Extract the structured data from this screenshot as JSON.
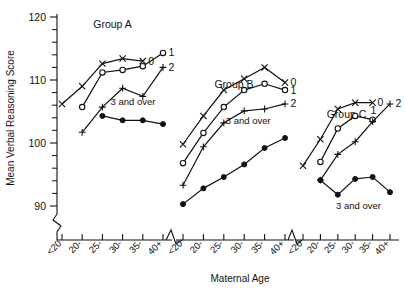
{
  "chart_data": {
    "type": "line",
    "title": "",
    "xlabel": "Maternal Age",
    "ylabel": "Mean Verbal Reasoning Score",
    "ylim": [
      88,
      121
    ],
    "yticks": [
      90,
      100,
      110,
      120
    ],
    "ytick_labels": [
      "90",
      "100",
      "110",
      "120"
    ],
    "y_axis_break": true,
    "grid": false,
    "legend_position": "inline-right-of-line-end",
    "categories": [
      "<20",
      "20-",
      "25-",
      "30-",
      "35-",
      "40+"
    ],
    "panels": [
      {
        "name": "Group A",
        "title": "Group A",
        "series": [
          {
            "name": "0",
            "label": "0",
            "marker": "x",
            "values": [
              106.2,
              109.0,
              112.6,
              113.4,
              113.0,
              null
            ]
          },
          {
            "name": "1",
            "label": "1",
            "marker": "open-circle",
            "values": [
              null,
              105.7,
              111.2,
              111.6,
              112.2,
              114.3
            ]
          },
          {
            "name": "2",
            "label": "2",
            "marker": "plus",
            "values": [
              null,
              101.7,
              105.7,
              108.7,
              107.4,
              112.0
            ]
          },
          {
            "name": "3 and over",
            "label": "3 and over",
            "marker": "filled-circle",
            "values": [
              null,
              null,
              104.3,
              103.6,
              103.6,
              103.0
            ]
          }
        ]
      },
      {
        "name": "Group B",
        "title": "Group B",
        "series": [
          {
            "name": "0",
            "label": "0",
            "marker": "x",
            "values": [
              99.8,
              104.3,
              108.4,
              110.2,
              112.0,
              109.6
            ]
          },
          {
            "name": "1",
            "label": "1",
            "marker": "open-circle",
            "values": [
              96.8,
              101.6,
              105.7,
              108.4,
              109.4,
              108.4
            ]
          },
          {
            "name": "2",
            "label": "2",
            "marker": "plus",
            "values": [
              93.3,
              99.4,
              103.2,
              105.1,
              105.4,
              106.2
            ]
          },
          {
            "name": "3 and over",
            "label": "3 and over",
            "marker": "filled-circle",
            "values": [
              90.3,
              92.8,
              94.6,
              96.6,
              99.2,
              100.8
            ]
          }
        ]
      },
      {
        "name": "Group C",
        "title": "Group C",
        "series": [
          {
            "name": "0",
            "label": "0",
            "marker": "x",
            "values": [
              96.4,
              100.6,
              105.4,
              106.4,
              106.4,
              null
            ]
          },
          {
            "name": "1",
            "label": "1",
            "marker": "open-circle",
            "values": [
              null,
              97.0,
              102.3,
              104.3,
              103.7,
              null
            ]
          },
          {
            "name": "2",
            "label": "2",
            "marker": "plus",
            "values": [
              null,
              94.1,
              98.2,
              100.2,
              103.4,
              106.2
            ]
          },
          {
            "name": "3 and over",
            "label": "3 and over",
            "marker": "filled-circle",
            "values": [
              null,
              94.1,
              91.8,
              94.3,
              94.6,
              92.2
            ]
          }
        ]
      }
    ]
  },
  "axes": {
    "y_title": "Mean Verbal Reasoning Score",
    "x_title": "Maternal Age",
    "y_tick_0": "90",
    "y_tick_1": "100",
    "y_tick_2": "110",
    "y_tick_3": "120"
  },
  "panel_titles": {
    "a": "Group A",
    "b": "Group B",
    "c": "Group C"
  },
  "series_labels": {
    "zero": "0",
    "one": "1",
    "two": "2",
    "three_plus": "3 and over"
  },
  "x_categories": {
    "c0": "<20",
    "c1": "20-",
    "c2": "25-",
    "c3": "30-",
    "c4": "35-",
    "c5": "40+"
  }
}
